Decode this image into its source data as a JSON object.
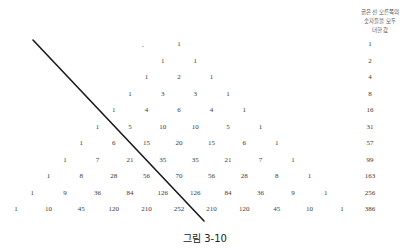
{
  "figure": {
    "caption": "그림 3-10",
    "header_lines": [
      "굵은 선 오른쪽의",
      "숫자들을 모두",
      "더한 값"
    ],
    "line_color": "#1a1a1a",
    "text_color": "#3a3a3a"
  },
  "triangle": {
    "rows": [
      [
        1
      ],
      [
        1,
        1
      ],
      [
        1,
        2,
        1
      ],
      [
        1,
        3,
        3,
        1
      ],
      [
        1,
        4,
        6,
        4,
        1
      ],
      [
        1,
        5,
        10,
        10,
        5,
        1
      ],
      [
        1,
        6,
        15,
        20,
        15,
        6,
        1
      ],
      [
        1,
        7,
        21,
        35,
        35,
        21,
        7,
        1
      ],
      [
        1,
        8,
        28,
        56,
        70,
        56,
        28,
        8,
        1
      ],
      [
        1,
        9,
        36,
        84,
        126,
        126,
        84,
        36,
        9,
        1
      ],
      [
        1,
        10,
        45,
        120,
        210,
        252,
        210,
        120,
        45,
        10,
        1
      ]
    ],
    "row_sums_right_of_line": [
      1,
      2,
      4,
      8,
      16,
      31,
      57,
      99,
      163,
      256,
      386
    ]
  },
  "thick_line": {
    "x1": 33,
    "y1": 40,
    "x2": 204,
    "y2": 221
  }
}
